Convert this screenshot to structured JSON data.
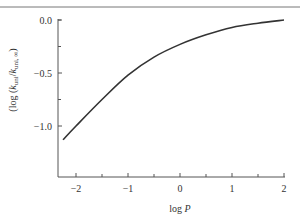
{
  "chart_data": {
    "type": "line",
    "title": "",
    "xlabel": "log P",
    "ylabel": "(log (k_uni / k_uni,∞)",
    "xlim": [
      -2.25,
      2.0
    ],
    "ylim": [
      -1.25,
      0.0
    ],
    "grid": false,
    "legend": null,
    "x_ticks": [
      -2,
      -1,
      0,
      1,
      2
    ],
    "x_tick_labels": [
      "−2",
      "−1",
      "0",
      "1",
      "2"
    ],
    "x_minor_ticks": [
      -1.5,
      -0.5,
      0.5,
      1.5
    ],
    "y_ticks": [
      0.0,
      -0.5,
      -1.0
    ],
    "y_tick_labels": [
      "0.0",
      "−0.5",
      "−1.0"
    ],
    "y_minor_ticks": [
      -0.25,
      -0.75
    ],
    "series": [
      {
        "name": "falloff curve",
        "color": "#333333",
        "x": [
          -2.25,
          -2.0,
          -1.5,
          -1.0,
          -0.5,
          0.0,
          0.5,
          1.0,
          1.5,
          2.0
        ],
        "values": [
          -1.13,
          -1.0,
          -0.75,
          -0.52,
          -0.35,
          -0.23,
          -0.14,
          -0.07,
          -0.03,
          0.0
        ]
      }
    ]
  },
  "labels": {
    "xlabel_main": "log ",
    "xlabel_var": "P",
    "ylabel_prefix": "(log (",
    "ylabel_k1": "k",
    "ylabel_sub1": "uni",
    "ylabel_slash": "/",
    "ylabel_k2": "k",
    "ylabel_sub2": "uni, ∞",
    "ylabel_suffix": ")"
  }
}
